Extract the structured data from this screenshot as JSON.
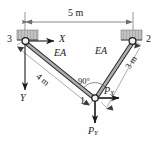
{
  "figure": {
    "type": "two-bar-truss-free-body-diagram",
    "colors": {
      "line": "#3b3b3b",
      "member_fill": "#9a9a9a",
      "member_edge": "#2b2b2b",
      "support_fill": "#b8b8b8",
      "dimension": "#6e6e6e",
      "text": "#1a1a1a",
      "background": "#fefefe"
    }
  },
  "dimensions": {
    "span": "5 m",
    "left_member_length": "4 m",
    "right_member_length": "3 m",
    "angle": "90°"
  },
  "nodes": {
    "left_support": "3",
    "right_support": "2",
    "joint": "1"
  },
  "axes": {
    "x_label": "X",
    "y_label": "Y"
  },
  "members": {
    "left_property": "EA",
    "right_property": "EA"
  },
  "loads": {
    "px_symbol": "P",
    "px_subscript": "X",
    "py_symbol": "P",
    "py_subscript": "Y"
  }
}
